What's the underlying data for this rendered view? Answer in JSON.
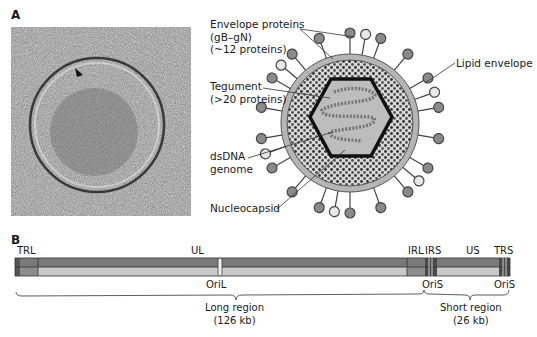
{
  "panel_a": {
    "letter": "A",
    "micrograph": {
      "description": "cryo-electron tomogram of herpesvirus virion",
      "arrowhead": "arrowhead-marker"
    },
    "labels": {
      "envelope_proteins": "Envelope proteins\n(gB–gN)\n(~12 proteins)",
      "tegument": "Tegument\n(>20 proteins)",
      "dsdna": "dsDNA\ngenome",
      "nucleocapsid": "Nucleocapsid",
      "lipid_envelope": "Lipid envelope"
    }
  },
  "panel_b": {
    "letter": "B",
    "segments": {
      "trl": "TRL",
      "ul": "UL",
      "irl": "IRL",
      "irs": "IRS",
      "us": "US",
      "trs": "TRS"
    },
    "origins": {
      "oril": "OriL",
      "oris_1": "OriS",
      "oris_2": "OriS"
    },
    "regions": {
      "long": "Long region\n(126 kb)",
      "short": "Short region\n(26 kb)"
    }
  },
  "colors": {
    "dark_gray": "#6f6f6f",
    "mid_gray": "#999999",
    "light_gray": "#c8c8c8",
    "capsid_fill": "#bdbdbd"
  }
}
